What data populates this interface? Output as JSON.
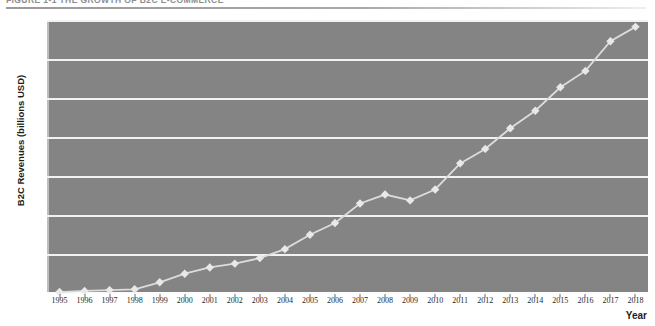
{
  "figure": {
    "caption": "FIGURE 1-1   THE GROWTH OF B2C E-COMMERCE",
    "caption_visible_fragment": "FIGURE 1-1  THE GROWTH OF"
  },
  "chart_data": {
    "type": "line",
    "title": "",
    "xlabel": "Year",
    "ylabel": "B2C Revenues (billions USD)",
    "xlim": [
      1994.5,
      2018.5
    ],
    "ylim": [
      0,
      700
    ],
    "yticks": [
      0,
      100,
      200,
      300,
      400,
      500,
      600,
      700
    ],
    "grid": true,
    "legend": "none",
    "marker": "diamond",
    "categories": [
      "1995",
      "1996",
      "1997",
      "1998",
      "1999",
      "2000",
      "2001",
      "2002",
      "2003",
      "2004",
      "2005",
      "2006",
      "2007",
      "2008",
      "2009",
      "2010",
      "2011",
      "2012",
      "2013",
      "2014",
      "2015",
      "2016",
      "2017",
      "2018"
    ],
    "x": [
      1995,
      1996,
      1997,
      1998,
      1999,
      2000,
      2001,
      2002,
      2003,
      2004,
      2005,
      2006,
      2007,
      2008,
      2009,
      2010,
      2011,
      2012,
      2013,
      2014,
      2015,
      2016,
      2017,
      2018
    ],
    "values": [
      5,
      8,
      10,
      12,
      30,
      52,
      68,
      78,
      92,
      115,
      152,
      182,
      232,
      255,
      240,
      268,
      335,
      372,
      425,
      470,
      530,
      572,
      648,
      685
    ],
    "colors": {
      "plot_background": "#848484",
      "gridline": "#f2f2f2",
      "line": "#dcdcdc",
      "marker_fill": "#e8e8e8",
      "axis_text": "#202020"
    }
  }
}
